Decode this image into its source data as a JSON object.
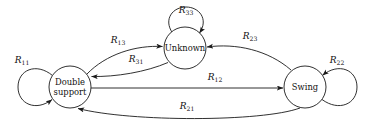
{
  "diagram": {
    "type": "state-transition-diagram",
    "title": "",
    "background_color": "#ffffff",
    "stroke_color": "#1a1a1a",
    "nodes": [
      {
        "id": "double-support",
        "label_line1": "Double",
        "label_line2": "support",
        "label": "Double support",
        "cx": 70,
        "cy": 87,
        "r": 21
      },
      {
        "id": "unknown",
        "label_line1": "Unknown",
        "label_line2": "",
        "label": "Unknown",
        "cx": 185,
        "cy": 48,
        "r": 21
      },
      {
        "id": "swing",
        "label_line1": "Swing",
        "label_line2": "",
        "label": "Swing",
        "cx": 305,
        "cy": 87,
        "r": 21
      }
    ],
    "edges": [
      {
        "id": "r11",
        "base": "R",
        "sub": "11",
        "from": "double-support",
        "to": "double-support",
        "kind": "self-loop",
        "label_x": 22,
        "label_y": 63
      },
      {
        "id": "r33",
        "base": "R",
        "sub": "33",
        "from": "unknown",
        "to": "unknown",
        "kind": "self-loop",
        "label_x": 186,
        "label_y": 13
      },
      {
        "id": "r22",
        "base": "R",
        "sub": "22",
        "from": "swing",
        "to": "swing",
        "kind": "self-loop",
        "label_x": 337,
        "label_y": 63
      },
      {
        "id": "r13",
        "base": "R",
        "sub": "13",
        "from": "double-support",
        "to": "unknown",
        "kind": "curve",
        "label_x": 118,
        "label_y": 43
      },
      {
        "id": "r31",
        "base": "R",
        "sub": "31",
        "from": "unknown",
        "to": "double-support",
        "kind": "curve",
        "label_x": 136,
        "label_y": 62
      },
      {
        "id": "r23",
        "base": "R",
        "sub": "23",
        "from": "swing",
        "to": "unknown",
        "kind": "curve",
        "label_x": 250,
        "label_y": 39
      },
      {
        "id": "r12",
        "base": "R",
        "sub": "12",
        "from": "double-support",
        "to": "swing",
        "kind": "straight",
        "label_x": 215,
        "label_y": 80
      },
      {
        "id": "r21",
        "base": "R",
        "sub": "21",
        "from": "swing",
        "to": "double-support",
        "kind": "curve",
        "label_x": 187,
        "label_y": 109
      }
    ]
  }
}
